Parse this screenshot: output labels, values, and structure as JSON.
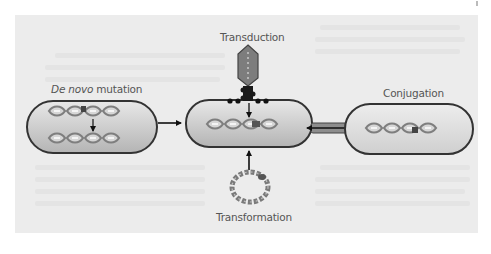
{
  "diagram": {
    "labels": {
      "de_novo_italic": "De novo",
      "de_novo_rest": " mutation",
      "transduction": "Transduction",
      "conjugation": "Conjugation",
      "transformation": "Transformation"
    },
    "nodes": [
      {
        "id": "de-novo-cell",
        "label": "De novo mutation"
      },
      {
        "id": "recipient-cell",
        "label": ""
      },
      {
        "id": "donor-cell",
        "label": "Conjugation"
      },
      {
        "id": "phage",
        "label": "Transduction"
      },
      {
        "id": "plasmid-ring",
        "label": "Transformation"
      }
    ],
    "edges": [
      {
        "from": "de-novo-cell",
        "to": "recipient-cell"
      },
      {
        "from": "donor-cell",
        "to": "recipient-cell",
        "via": "pilus"
      },
      {
        "from": "phage",
        "to": "recipient-cell"
      },
      {
        "from": "plasmid-ring",
        "to": "recipient-cell"
      }
    ],
    "colors": {
      "panel": "#ececec",
      "cell_fill_top": "#e6e6e6",
      "cell_fill_bottom": "#b9b9b9",
      "cell_stroke": "#3a3a3a",
      "dna": "#8a8a8a",
      "dna_light": "#d4d4d4",
      "mutation": "#444444",
      "phage_head": "#7a7a7a",
      "arrow": "#111111"
    }
  }
}
